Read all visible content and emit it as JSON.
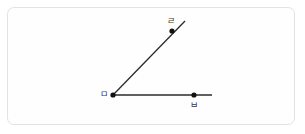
{
  "figure": {
    "kind": "geometry-angle-diagram",
    "canvas": {
      "width": 305,
      "height": 134,
      "background": "#ffffff"
    },
    "frame": {
      "name": "figure-border",
      "x": 7,
      "y": 7,
      "width": 288,
      "height": 118,
      "border_color": "#e3e3e3",
      "corner_radius": 7
    },
    "style": {
      "stroke_color": "#2b2b2b",
      "stroke_width": 1.3,
      "point_color": "#111111",
      "point_radius": 2.6,
      "label_color": "#3a3a3a",
      "label_font_size": 9
    },
    "points": [
      {
        "id": "vertex",
        "label": "ㅁ",
        "x": 113,
        "y": 95,
        "label_x": 100,
        "label_y": 90
      },
      {
        "id": "ray-up-pt",
        "label": "ㄹ",
        "x": 172,
        "y": 31,
        "label_x": 167,
        "label_y": 17
      },
      {
        "id": "ray-right-pt",
        "label": "ㅂ",
        "x": 194,
        "y": 95,
        "label_x": 190,
        "label_y": 101
      }
    ],
    "rays": [
      {
        "id": "ray-horizontal",
        "from": "vertex",
        "x1": 113,
        "y1": 95,
        "x2": 212,
        "y2": 95,
        "through": "ㅂ"
      },
      {
        "id": "ray-diagonal",
        "from": "vertex",
        "x1": 113,
        "y1": 95,
        "x2": 185,
        "y2": 21,
        "through": "ㄹ"
      }
    ],
    "angle": {
      "name": "∠ㄹㅁㅂ",
      "vertex_label": "ㅁ",
      "arm_labels": [
        "ㄹ",
        "ㅂ"
      ]
    }
  }
}
